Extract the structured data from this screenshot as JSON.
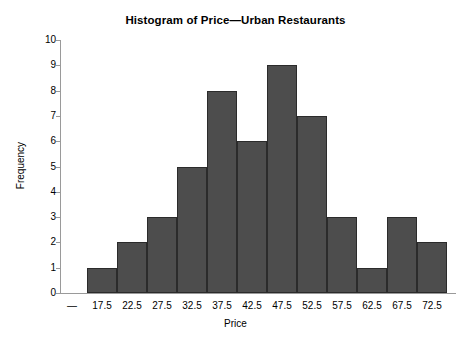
{
  "chart_data": {
    "type": "bar",
    "title": "Histogram of Price—Urban Restaurants",
    "xlabel": "Price",
    "ylabel": "Frequency",
    "categories": [
      "17.5",
      "22.5",
      "27.5",
      "32.5",
      "37.5",
      "42.5",
      "47.5",
      "52.5",
      "57.5",
      "62.5",
      "67.5",
      "72.5"
    ],
    "values": [
      1,
      2,
      3,
      5,
      8,
      6,
      9,
      7,
      3,
      1,
      3,
      2
    ],
    "ylim": [
      0,
      10
    ],
    "ytick_labels": [
      "10",
      "9",
      "8",
      "7",
      "6",
      "5",
      "4",
      "3",
      "2",
      "1",
      "0"
    ],
    "ytick_values": [
      10,
      9,
      8,
      7,
      6,
      5,
      4,
      3,
      2,
      1,
      0
    ],
    "xtick_leading_label": "—",
    "grid": false,
    "legend": false,
    "bar_fill_color": "#4d4d4d",
    "bar_border_color": "#2b2b2b",
    "axis_color": "#9a9a9a",
    "background_color": "#ffffff"
  }
}
